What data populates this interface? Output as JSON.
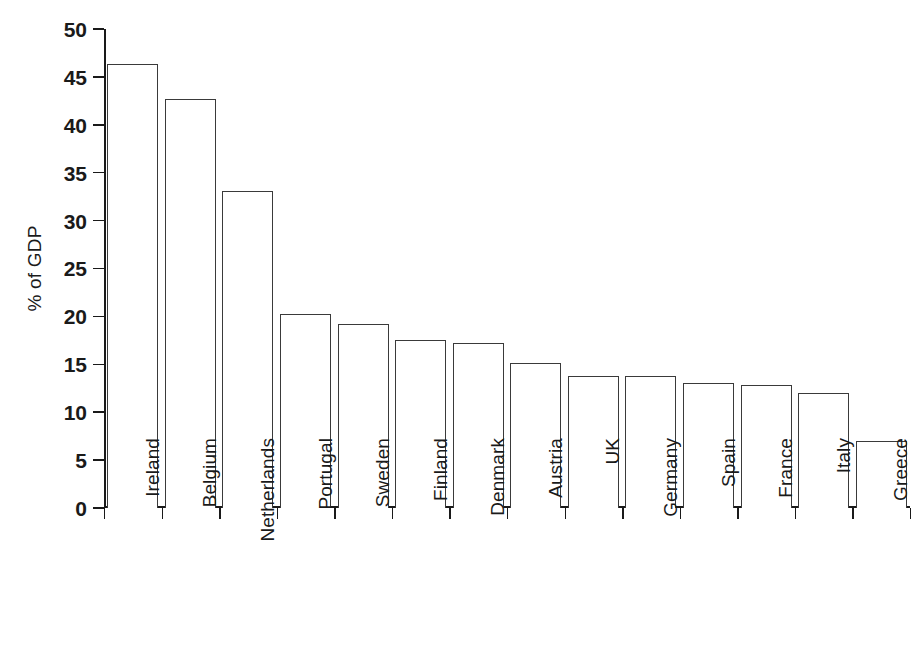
{
  "chart_data": {
    "type": "bar",
    "title": "",
    "subtitle": "",
    "xlabel": "",
    "ylabel": "% of GDP",
    "categories": [
      "Ireland",
      "Belgium",
      "Netherlands",
      "Portugal",
      "Sweden",
      "Finland",
      "Denmark",
      "Austria",
      "UK",
      "Germany",
      "Spain",
      "France",
      "Italy",
      "Greece"
    ],
    "values": [
      46.3,
      42.7,
      33.1,
      20.2,
      19.2,
      17.5,
      17.2,
      15.1,
      13.8,
      13.8,
      13.0,
      12.8,
      12.0,
      7.0
    ],
    "ylim": [
      0,
      50
    ],
    "ytick_labels": [
      "0",
      "5",
      "10",
      "15",
      "20",
      "25",
      "30",
      "35",
      "40",
      "45",
      "50"
    ],
    "ytick_values": [
      0,
      5,
      10,
      15,
      20,
      25,
      30,
      35,
      40,
      45,
      50
    ],
    "grid": false,
    "legend": false,
    "legend_position": "none",
    "bar_fill_color": "#ffffff",
    "bar_edge_color": "#3a3a3a",
    "axis_color": "#1a1a1a",
    "background_color": "#ffffff"
  }
}
